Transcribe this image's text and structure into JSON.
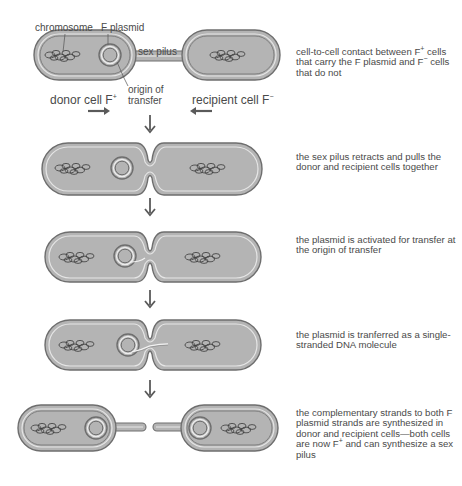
{
  "labels": {
    "chromosome": "chromosome",
    "f_plasmid": "F plasmid",
    "sex_pilus": "sex pilus",
    "origin_of_transfer_1": "origin of",
    "origin_of_transfer_2": "transfer",
    "donor_cell": "donor cell F",
    "donor_sup": "+",
    "recipient_cell": "recipient cell F",
    "recipient_sup": "−"
  },
  "steps": [
    {
      "id": 1,
      "description_parts": [
        "cell-to-cell contact between F",
        "+",
        " cells that carry the F plasmid and F",
        "−",
        " cells that do not"
      ]
    },
    {
      "id": 2,
      "description": "the sex pilus retracts and pulls the donor and recipient cells together"
    },
    {
      "id": 3,
      "description": "the plasmid is activated for transfer at the origin of transfer"
    },
    {
      "id": 4,
      "description": "the plasmid is tranferred as a single-stranded DNA molecule"
    },
    {
      "id": 5,
      "description_parts": [
        "the complementary strands to both F plasmid strands are synthesized in donor and recipient cells—both cells are now F",
        "+",
        " and can synthesize a sex pilus"
      ]
    }
  ],
  "colors": {
    "cell_fill": "#b4b4b4",
    "cell_outline": "#6e6e6e",
    "membrane_highlight": "#e6e6e6",
    "arrow": "#5a5a5a",
    "text": "#4a4a4a"
  }
}
